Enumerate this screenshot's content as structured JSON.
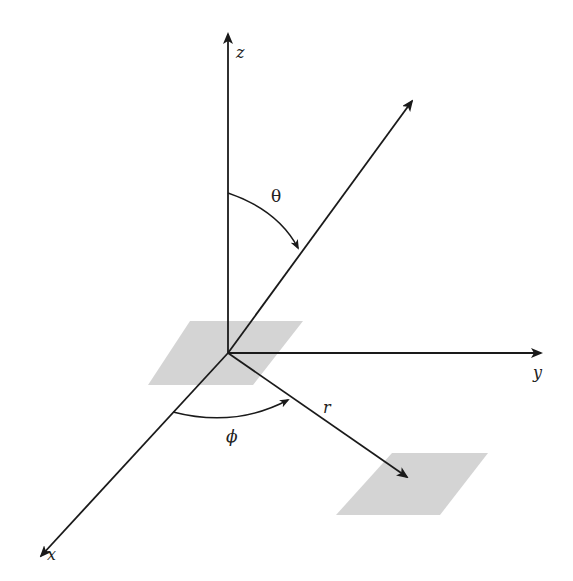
{
  "diagram": {
    "axes": [
      {
        "name": "z",
        "label": "z"
      },
      {
        "name": "y",
        "label": "y"
      },
      {
        "name": "x",
        "label": "x"
      }
    ],
    "labels": {
      "z_axis": "z",
      "y_axis": "y",
      "x_axis": "x",
      "theta": "θ",
      "phi": "ϕ",
      "radius": "r"
    },
    "colors": {
      "line": "#1a1a1a",
      "plane": "#d4d4d4",
      "background": "#ffffff"
    }
  }
}
